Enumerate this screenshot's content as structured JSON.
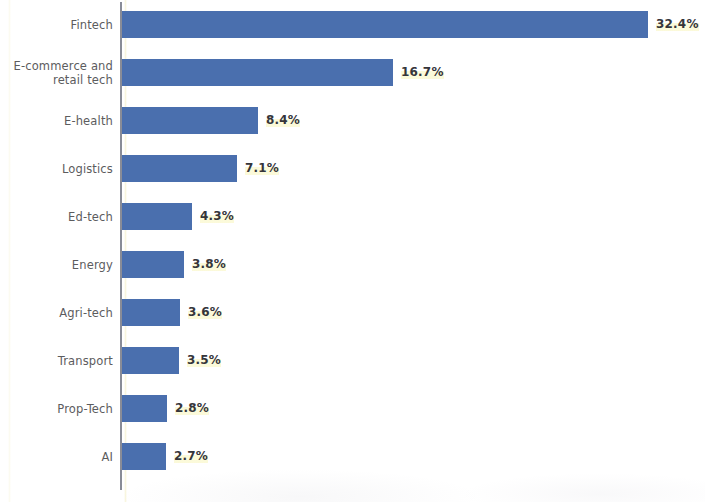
{
  "chart_data": {
    "type": "bar",
    "orientation": "horizontal",
    "title": "",
    "subtitle": "",
    "xlabel": "",
    "ylabel": "",
    "xlim": [
      0,
      32.4
    ],
    "grid": false,
    "legend": null,
    "value_suffix": "%",
    "categories": [
      "Fintech",
      "E-commerce and retail tech",
      "E-health",
      "Logistics",
      "Ed-tech",
      "Energy",
      "Agri-tech",
      "Transport",
      "Prop-Tech",
      "AI"
    ],
    "values": [
      32.4,
      16.7,
      8.4,
      7.1,
      4.3,
      3.8,
      3.6,
      3.5,
      2.8,
      2.7
    ],
    "value_labels": [
      "32.4%",
      "16.7%",
      "8.4%",
      "7.1%",
      "4.3%",
      "3.8%",
      "3.6%",
      "3.5%",
      "2.8%",
      "2.7%"
    ],
    "category_lines": [
      [
        "Fintech"
      ],
      [
        "E-commerce and",
        "retail tech"
      ],
      [
        "E-health"
      ],
      [
        "Logistics"
      ],
      [
        "Ed-tech"
      ],
      [
        "Energy"
      ],
      [
        "Agri-tech"
      ],
      [
        "Transport"
      ],
      [
        "Prop-Tech"
      ],
      [
        "AI"
      ]
    ],
    "colors": {
      "bar": "#4a6fae",
      "background": "#ffffff",
      "axis_line": "#7c7f8c",
      "category_label": "#5c5c5e",
      "value_label": "#35353a"
    }
  }
}
